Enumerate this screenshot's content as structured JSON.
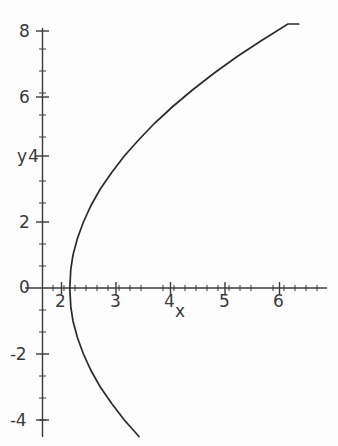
{
  "figure": {
    "background_color": "#fdfdfd",
    "curve_color": "#2b2b2b",
    "axis_color": "#3a3a3a",
    "text_color": "#3a3a3a"
  },
  "axes": {
    "x_label": "x",
    "y_label": "y",
    "x_ticks": [
      {
        "value": 2,
        "label": "2"
      },
      {
        "value": 3,
        "label": "3"
      },
      {
        "value": 4,
        "label": "4"
      },
      {
        "value": 5,
        "label": "5"
      },
      {
        "value": 6,
        "label": "6"
      }
    ],
    "y_ticks": [
      {
        "value": 8,
        "label": "8"
      },
      {
        "value": 6,
        "label": "6"
      },
      {
        "value": 4,
        "label": "4"
      },
      {
        "value": 2,
        "label": "2"
      },
      {
        "value": 0,
        "label": "0"
      },
      {
        "value": -2,
        "label": "-2"
      },
      {
        "value": -4,
        "label": "-4"
      }
    ],
    "origin_label": "0",
    "x_minor_tick_step": 0.2,
    "y_minor_tick_step": 0.5
  },
  "chart_data": {
    "type": "line",
    "title": "",
    "xlabel": "x",
    "ylabel": "y",
    "xlim": [
      1.0,
      6.5
    ],
    "ylim": [
      -4.3,
      8.2
    ],
    "grid": false,
    "legend": null,
    "series": [
      {
        "name": "upper-branch",
        "x": [
          1.5,
          1.52,
          1.56,
          1.64,
          1.75,
          1.89,
          2.06,
          2.27,
          2.5,
          2.77,
          3.06,
          3.39,
          3.75,
          4.14,
          4.56,
          5.02,
          5.5,
          5.7
        ],
        "y": [
          0.0,
          0.57,
          1.0,
          1.5,
          2.0,
          2.5,
          3.0,
          3.5,
          4.0,
          4.5,
          5.0,
          5.5,
          6.0,
          6.5,
          7.0,
          7.5,
          8.0,
          8.0
        ]
      },
      {
        "name": "lower-branch",
        "x": [
          1.5,
          1.52,
          1.56,
          1.64,
          1.75,
          1.89,
          2.06,
          2.27,
          2.5,
          2.77,
          3.06,
          3.39,
          3.75,
          4.14,
          4.56,
          5.02,
          5.5,
          6.4
        ],
        "y": [
          0.0,
          -0.57,
          -1.0,
          -1.5,
          -2.0,
          -2.5,
          -3.0,
          -3.5,
          -4.0,
          -4.5,
          -5.0,
          -5.5,
          -6.0,
          -6.5,
          -7.0,
          -7.5,
          -8.0,
          -8.8
        ]
      }
    ],
    "vertex": {
      "x": 1.5,
      "y": 0
    }
  }
}
